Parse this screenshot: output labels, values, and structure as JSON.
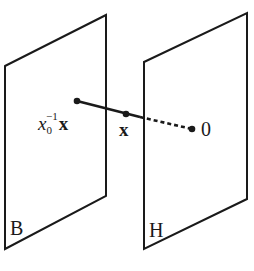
{
  "diagram": {
    "planes": [
      {
        "id": "B",
        "label": "B",
        "points": "5,66 106,15 106,196 5,249"
      },
      {
        "id": "H",
        "label": "H",
        "points": "144,62 247,13 247,199 144,249"
      }
    ],
    "points": [
      {
        "id": "x0inv_x",
        "label_base": "x",
        "label_sub": "0",
        "label_sup": "−1",
        "label_bold": "x",
        "cx": 77,
        "cy": 101
      },
      {
        "id": "x",
        "label": "x",
        "cx": 126,
        "cy": 114
      },
      {
        "id": "origin",
        "label": "0",
        "cx": 192,
        "cy": 129
      }
    ],
    "segments": {
      "solid": {
        "x1": 77,
        "y1": 101,
        "x2": 140,
        "y2": 117
      },
      "dashed": {
        "x1": 140,
        "y1": 117,
        "x2": 192,
        "y2": 129
      }
    },
    "colors": {
      "stroke": "#1a1a1a",
      "background": "#ffffff"
    }
  }
}
